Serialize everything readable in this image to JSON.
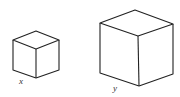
{
  "figure": {
    "cubes": [
      {
        "label": "x",
        "size": "small"
      },
      {
        "label": "y",
        "size": "large"
      }
    ],
    "stroke_color": "#222222"
  }
}
